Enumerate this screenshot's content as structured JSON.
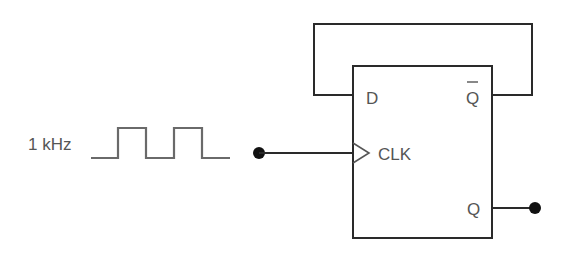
{
  "diagram": {
    "type": "D flip-flop toggle (divide-by-2) circuit",
    "input": {
      "label": "1 kHz",
      "waveform": "square-wave"
    },
    "flip_flop": {
      "pins": {
        "d": "D",
        "q_bar": "Q",
        "clk": "CLK",
        "q": "Q"
      }
    },
    "connections": [
      {
        "from": "Q_bar",
        "to": "D",
        "description": "feedback loop"
      },
      {
        "from": "input",
        "to": "CLK"
      },
      {
        "from": "Q",
        "to": "output"
      }
    ],
    "colors": {
      "line": "#2a2a2a",
      "text": "#555555",
      "waveform": "#6a6a6a",
      "background": "#ffffff"
    }
  }
}
